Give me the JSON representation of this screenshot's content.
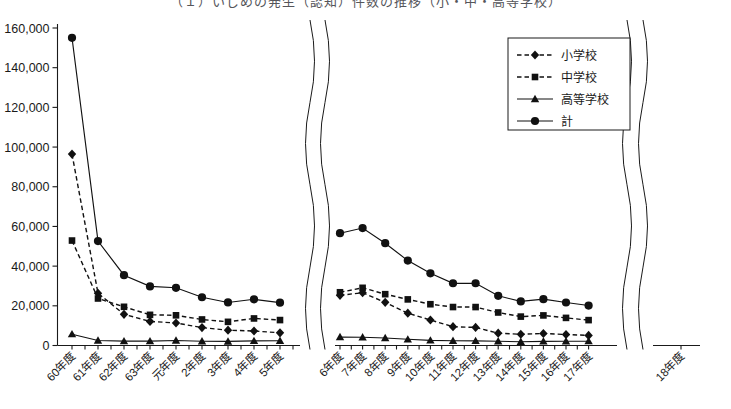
{
  "title_fragment": "（１）いじめの発生（認知）件数の推移（小・中・高等学校）",
  "chart_data": {
    "type": "line",
    "title": "",
    "xlabel": "",
    "ylabel": "",
    "ylim": [
      0,
      160000
    ],
    "ytick_step": 20000,
    "grid": false,
    "legend_position": "top-right",
    "axis_breaks": 2,
    "ytick_labels": [
      "0",
      "20,000",
      "40,000",
      "60,000",
      "80,000",
      "100,000",
      "120,000",
      "140,000",
      "160,000"
    ],
    "ytick_values": [
      0,
      20000,
      40000,
      60000,
      80000,
      100000,
      120000,
      140000,
      160000
    ],
    "panels": [
      {
        "name": "left-panel",
        "categories": [
          "60年度",
          "61年度",
          "62年度",
          "63年度",
          "元年度",
          "2年度",
          "3年度",
          "4年度",
          "5年度"
        ],
        "series": [
          {
            "name": "小学校",
            "marker": "diamond",
            "line": "dashed",
            "values": [
              96457,
              26306,
              15727,
              12122,
              11350,
              9035,
              7718,
              7300,
              6390
            ]
          },
          {
            "name": "中学校",
            "marker": "square",
            "line": "dashed",
            "values": [
              52891,
              23690,
              19500,
              15452,
              15215,
              13121,
              11922,
              13632,
              12817
            ]
          },
          {
            "name": "高等学校",
            "marker": "triangle",
            "line": "solid",
            "values": [
              5718,
              2544,
              2212,
              2212,
              2523,
              2152,
              2043,
              2326,
              2391
            ]
          },
          {
            "name": "計",
            "marker": "circle",
            "line": "solid",
            "values": [
              155066,
              52610,
              35439,
              29786,
              29088,
              24308,
              21683,
              23258,
              21598
            ]
          }
        ]
      },
      {
        "name": "right-panel",
        "categories": [
          "6年度",
          "7年度",
          "8年度",
          "9年度",
          "10年度",
          "11年度",
          "12年度",
          "13年度",
          "14年度",
          "15年度",
          "16年度",
          "17年度",
          "18年度"
        ],
        "series": [
          {
            "name": "小学校",
            "marker": "diamond",
            "line": "dashed",
            "values": [
              25295,
              26614,
              21733,
              16294,
              12858,
              9462,
              9114,
              6206,
              5659,
              6051,
              5551,
              5087,
              null
            ]
          },
          {
            "name": "中学校",
            "marker": "square",
            "line": "dashed",
            "values": [
              26828,
              29069,
              25862,
              23234,
              20801,
              19383,
              19371,
              16635,
              14562,
              15159,
              13915,
              12794,
              null
            ]
          },
          {
            "name": "高等学校",
            "marker": "triangle",
            "line": "solid",
            "values": [
              4253,
              4184,
              3771,
              3103,
              2576,
              2391,
              2327,
              2119,
              1906,
              2070,
              2121,
              2191,
              null
            ]
          },
          {
            "name": "計",
            "marker": "circle",
            "line": "solid",
            "values": [
              56601,
              59198,
              51544,
              42790,
              36396,
              31359,
              31359,
              25037,
              22205,
              23351,
              21671,
              20143,
              null
            ]
          }
        ]
      }
    ],
    "legend": [
      {
        "label": "小学校",
        "marker": "diamond",
        "line": "dashed"
      },
      {
        "label": "中学校",
        "marker": "square",
        "line": "dashed"
      },
      {
        "label": "高等学校",
        "marker": "triangle",
        "line": "solid"
      },
      {
        "label": "計",
        "marker": "circle",
        "line": "solid"
      }
    ]
  }
}
